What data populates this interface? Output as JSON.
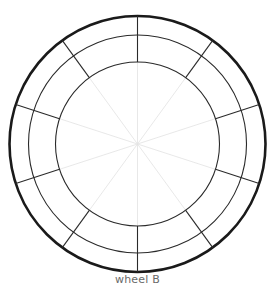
{
  "diagram": {
    "caption": "wheel B",
    "center": {
      "x": 137.5,
      "y": 144
    },
    "rings": [
      {
        "name": "outer",
        "radius": 128,
        "stroke": "#1a1a1a",
        "width": 2.6
      },
      {
        "name": "middle",
        "radius": 109,
        "stroke": "#2a2a2a",
        "width": 1.1
      },
      {
        "name": "inner",
        "radius": 82,
        "stroke": "#2a2a2a",
        "width": 1.1
      }
    ],
    "segments": 10,
    "start_angle_deg": 0,
    "spokes": {
      "from_radius": 82,
      "to_radius": 128,
      "stroke": "#2a2a2a",
      "width": 1.1
    },
    "guide_lines": {
      "from_radius": 0,
      "to_radius": 82,
      "stroke": "#e2e2e2",
      "width": 0.8
    }
  }
}
